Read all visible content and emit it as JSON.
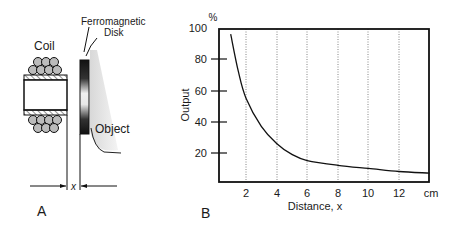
{
  "panel_a": {
    "label": "A",
    "coil_label": "Coil",
    "disk_label_line1": "Ferromagnetic",
    "disk_label_line2": "Disk",
    "object_label": "Object",
    "distance_label": "x"
  },
  "panel_b": {
    "label": "B",
    "y_unit": "%",
    "y_axis_label": "Output",
    "x_axis_label": "Distance, x",
    "x_unit": "cm",
    "y_ticks": [
      "20",
      "40",
      "60",
      "80",
      "100"
    ],
    "x_ticks": [
      "2",
      "4",
      "6",
      "8",
      "10",
      "12"
    ]
  },
  "chart_data": {
    "type": "line",
    "title": "",
    "xlabel": "Distance, x (cm)",
    "ylabel": "Output (%)",
    "xlim": [
      0.3,
      14
    ],
    "ylim": [
      0,
      100
    ],
    "x_ticks": [
      2,
      4,
      6,
      8,
      10,
      12
    ],
    "y_ticks": [
      20,
      40,
      60,
      80,
      100
    ],
    "grid": "vertical dotted lines at x ticks",
    "series": [
      {
        "name": "Output",
        "x": [
          1.0,
          1.5,
          2,
          3,
          4,
          5,
          6,
          8,
          10,
          12,
          14
        ],
        "y": [
          96,
          72,
          55,
          37,
          26,
          19,
          15,
          12,
          10,
          8,
          7
        ]
      }
    ]
  }
}
